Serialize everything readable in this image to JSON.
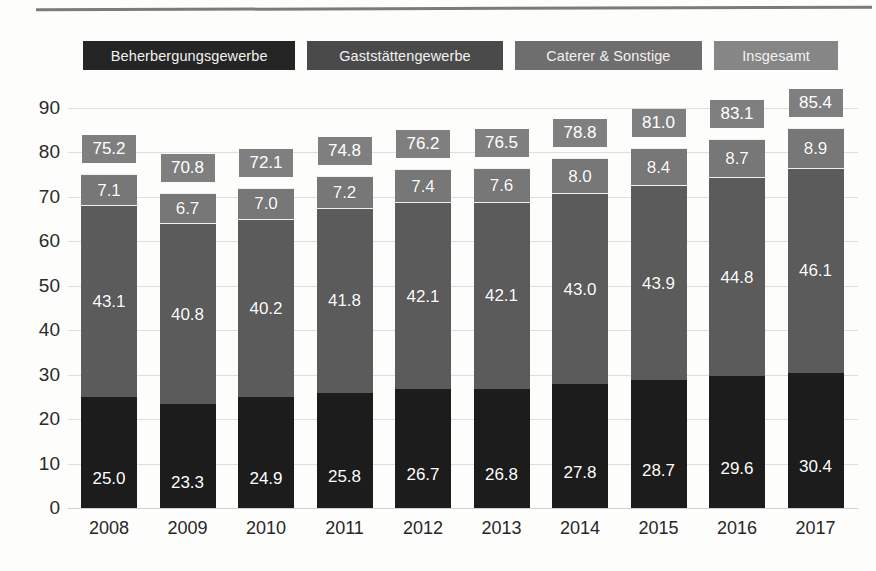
{
  "page": {
    "background_color": "#fdfdfc",
    "rule_color": "#7b7b7b"
  },
  "legend": {
    "items": [
      {
        "label": "Beherbergungsgewerbe",
        "color": "#252525"
      },
      {
        "label": "Gaststättengewerbe",
        "color": "#4a4a4a"
      },
      {
        "label": "Caterer & Sonstige",
        "color": "#6e6e6e"
      },
      {
        "label": "Insgesamt",
        "color": "#868686"
      }
    ]
  },
  "chart_data": {
    "type": "bar",
    "stacked": true,
    "title": "",
    "xlabel": "",
    "ylabel": "",
    "ylim": [
      0,
      90
    ],
    "yticks": [
      "0",
      "10",
      "20",
      "30",
      "40",
      "50",
      "60",
      "70",
      "80",
      "90"
    ],
    "grid": true,
    "legend_position": "top",
    "categories": [
      "2008",
      "2009",
      "2010",
      "2011",
      "2012",
      "2013",
      "2014",
      "2015",
      "2016",
      "2017"
    ],
    "series": [
      {
        "name": "Beherbergungsgewerbe",
        "color": "#1c1c1c",
        "values": [
          25.0,
          23.3,
          24.9,
          25.8,
          26.7,
          26.8,
          27.8,
          28.7,
          29.6,
          30.4
        ],
        "labels": [
          "25.0",
          "23.3",
          "24.9",
          "25.8",
          "26.7",
          "26.8",
          "27.8",
          "28.7",
          "29.6",
          "30.4"
        ]
      },
      {
        "name": "Gaststättengewerbe",
        "color": "#5b5b5b",
        "values": [
          43.1,
          40.8,
          40.2,
          41.8,
          42.1,
          42.1,
          43.0,
          43.9,
          44.8,
          46.1
        ],
        "labels": [
          "43.1",
          "40.8",
          "40.2",
          "41.8",
          "42.1",
          "42.1",
          "43.0",
          "43.9",
          "44.8",
          "46.1"
        ]
      },
      {
        "name": "Caterer & Sonstige",
        "color": "#777777",
        "values": [
          7.1,
          6.7,
          7.0,
          7.2,
          7.4,
          7.6,
          8.0,
          8.4,
          8.7,
          8.9
        ],
        "labels": [
          "7.1",
          "6.7",
          "7.0",
          "7.2",
          "7.4",
          "7.6",
          "8.0",
          "8.4",
          "8.7",
          "8.9"
        ]
      }
    ],
    "totals": {
      "name": "Insgesamt",
      "color": "#7f7f7f",
      "values": [
        75.2,
        70.8,
        72.1,
        74.8,
        76.2,
        76.5,
        78.8,
        81.0,
        83.1,
        85.4
      ],
      "labels": [
        "75.2",
        "70.8",
        "72.1",
        "74.8",
        "76.2",
        "76.5",
        "78.8",
        "81.0",
        "83.1",
        "85.4"
      ]
    }
  }
}
